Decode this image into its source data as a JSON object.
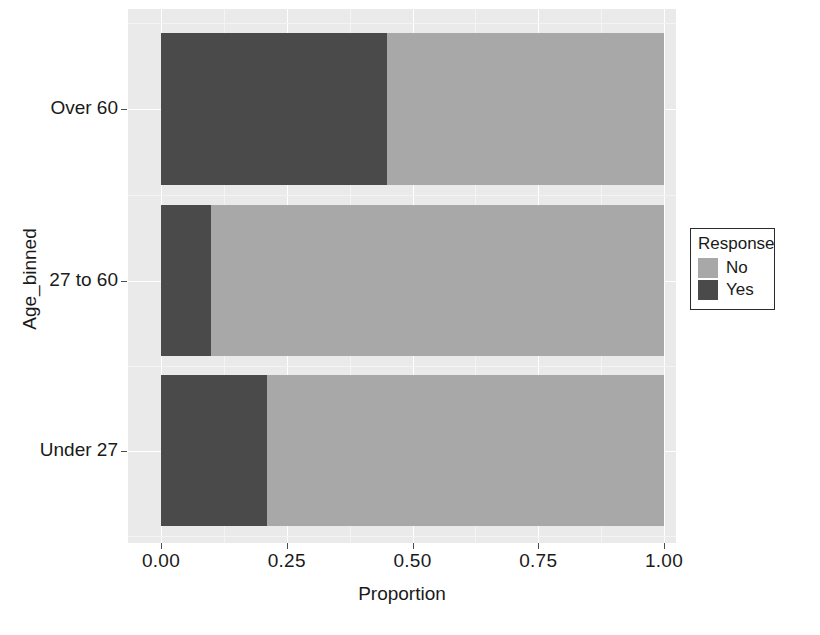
{
  "chart_data": {
    "type": "bar",
    "orientation": "horizontal",
    "stacked": true,
    "normalized": true,
    "title": "",
    "xlabel": "Proportion",
    "ylabel": "Age_binned",
    "categories": [
      "Under 27",
      "27 to 60",
      "Over 60"
    ],
    "category_order_top_to_bottom": [
      "Over 60",
      "27 to 60",
      "Under 27"
    ],
    "series": [
      {
        "name": "No",
        "color": "#a8a8a8",
        "values": [
          0.79,
          0.9,
          0.55
        ]
      },
      {
        "name": "Yes",
        "color": "#4a4a4a",
        "values": [
          0.21,
          0.1,
          0.45
        ]
      }
    ],
    "xlim": [
      0.0,
      1.0
    ],
    "xticks": [
      0.0,
      0.25,
      0.5,
      0.75,
      1.0
    ],
    "xtick_labels": [
      "0.00",
      "0.25",
      "0.50",
      "0.75",
      "1.00"
    ],
    "grid": true,
    "legend": {
      "title": "Response",
      "position": "right",
      "entries": [
        {
          "label": "No",
          "color": "#a8a8a8"
        },
        {
          "label": "Yes",
          "color": "#4a4a4a"
        }
      ]
    },
    "panel_background": "#eaeaea",
    "gridline_color": "#ffffff"
  },
  "axes": {
    "x": {
      "title": "Proportion",
      "ticks": [
        {
          "value": 0.0,
          "label": "0.00"
        },
        {
          "value": 0.25,
          "label": "0.25"
        },
        {
          "value": 0.5,
          "label": "0.50"
        },
        {
          "value": 0.75,
          "label": "0.75"
        },
        {
          "value": 1.0,
          "label": "1.00"
        }
      ]
    },
    "y": {
      "title": "Age_binned",
      "ticks": [
        {
          "label": "Over 60"
        },
        {
          "label": "27 to 60"
        },
        {
          "label": "Under 27"
        }
      ]
    }
  },
  "bars": [
    {
      "category": "Over 60",
      "segments": [
        {
          "response": "Yes",
          "proportion": 0.45,
          "color": "#4a4a4a"
        },
        {
          "response": "No",
          "proportion": 0.55,
          "color": "#a8a8a8"
        }
      ]
    },
    {
      "category": "27 to 60",
      "segments": [
        {
          "response": "Yes",
          "proportion": 0.1,
          "color": "#4a4a4a"
        },
        {
          "response": "No",
          "proportion": 0.9,
          "color": "#a8a8a8"
        }
      ]
    },
    {
      "category": "Under 27",
      "segments": [
        {
          "response": "Yes",
          "proportion": 0.21,
          "color": "#4a4a4a"
        },
        {
          "response": "No",
          "proportion": 0.79,
          "color": "#a8a8a8"
        }
      ]
    }
  ],
  "legend": {
    "title": "Response",
    "items": [
      {
        "label": "No",
        "color": "#a8a8a8"
      },
      {
        "label": "Yes",
        "color": "#4a4a4a"
      }
    ]
  }
}
